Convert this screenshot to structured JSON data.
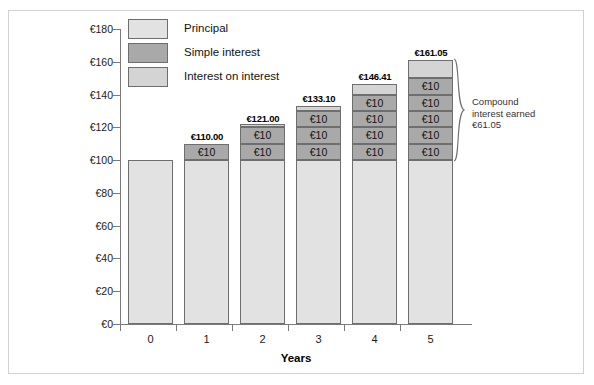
{
  "chart_data": {
    "type": "bar",
    "title": "",
    "xlabel": "Years",
    "ylabel": "",
    "categories": [
      "0",
      "1",
      "2",
      "3",
      "4",
      "5"
    ],
    "ylim": [
      0,
      180
    ],
    "yticks": [
      0,
      20,
      40,
      60,
      80,
      100,
      120,
      140,
      160,
      180
    ],
    "ytick_labels": [
      "€0",
      "€20",
      "€40",
      "€60",
      "€80",
      "€100",
      "€120",
      "€140",
      "€160",
      "€180"
    ],
    "grid": false,
    "legend_position": "upper-left-inside",
    "stacked": true,
    "series": [
      {
        "name": "Principal",
        "color": "#e2e2e2",
        "values": [
          100,
          100,
          100,
          100,
          100,
          100
        ]
      },
      {
        "name": "Simple interest",
        "color": "#a9a9a9",
        "values": [
          0,
          10,
          20,
          30,
          40,
          50
        ]
      },
      {
        "name": "Interest on interest",
        "color": "#d4d4d4",
        "values": [
          0,
          0,
          1.0,
          3.1,
          6.41,
          11.05
        ]
      }
    ],
    "totals": [
      100,
      110.0,
      121.0,
      133.1,
      146.41,
      161.05
    ],
    "total_labels": [
      "",
      "€110.00",
      "€121.00",
      "€133.10",
      "€146.41",
      "€161.05"
    ],
    "segment_label": "€10",
    "annotations": [
      {
        "name": "compound-interest-earned",
        "lines": [
          "Compound",
          "interest earned",
          "€61.05"
        ]
      }
    ]
  },
  "legend": {
    "items": [
      {
        "label": "Principal",
        "swatch": "principal"
      },
      {
        "label": "Simple interest",
        "swatch": "simple"
      },
      {
        "label": "Interest on interest",
        "swatch": "ioi"
      }
    ]
  },
  "axes": {
    "x_title": "Years",
    "x_labels": [
      "0",
      "1",
      "2",
      "3",
      "4",
      "5"
    ],
    "y_labels": [
      "€180",
      "€160",
      "€140",
      "€120",
      "€100",
      "€80",
      "€60",
      "€40",
      "€20",
      "€0"
    ]
  },
  "annotation": {
    "line1": "Compound",
    "line2": "interest earned",
    "line3": "€61.05"
  },
  "bars": [
    {
      "total_label": "",
      "principal": 100,
      "simple_count": 0,
      "ioi": 0
    },
    {
      "total_label": "€110.00",
      "principal": 100,
      "simple_count": 1,
      "ioi": 0
    },
    {
      "total_label": "€121.00",
      "principal": 100,
      "simple_count": 2,
      "ioi": 1.0
    },
    {
      "total_label": "€133.10",
      "principal": 100,
      "simple_count": 3,
      "ioi": 3.1
    },
    {
      "total_label": "€146.41",
      "principal": 100,
      "simple_count": 4,
      "ioi": 6.41
    },
    {
      "total_label": "€161.05",
      "principal": 100,
      "simple_count": 5,
      "ioi": 11.05
    }
  ],
  "segment_label": "€10",
  "colors": {
    "principal": "#e2e2e2",
    "simple": "#a9a9a9",
    "interest_on_interest": "#d4d4d4",
    "outline": "#6e6e6e",
    "axis": "#7a7a7a",
    "frame": "#d2d2d2"
  }
}
